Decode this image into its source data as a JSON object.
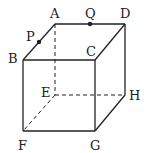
{
  "diagram": {
    "type": "cube",
    "vertices": {
      "A": {
        "label": "A",
        "x": 55,
        "y": 24
      },
      "D": {
        "label": "D",
        "x": 125,
        "y": 24
      },
      "B": {
        "label": "B",
        "x": 23,
        "y": 60
      },
      "C": {
        "label": "C",
        "x": 95,
        "y": 60
      },
      "E": {
        "label": "E",
        "x": 55,
        "y": 95
      },
      "H": {
        "label": "H",
        "x": 125,
        "y": 95
      },
      "F": {
        "label": "F",
        "x": 23,
        "y": 131
      },
      "G": {
        "label": "G",
        "x": 95,
        "y": 131
      }
    },
    "points": {
      "P": {
        "label": "P",
        "on_edge": "AB",
        "x": 39,
        "y": 42
      },
      "Q": {
        "label": "Q",
        "on_edge": "AD",
        "x": 90,
        "y": 24
      }
    },
    "solid_edges": [
      "AD",
      "AB",
      "DC",
      "BC",
      "DH",
      "BF",
      "CG",
      "FG",
      "GH"
    ],
    "hidden_edges": [
      "AE",
      "EF",
      "EH"
    ],
    "stroke_color": "#222222"
  }
}
